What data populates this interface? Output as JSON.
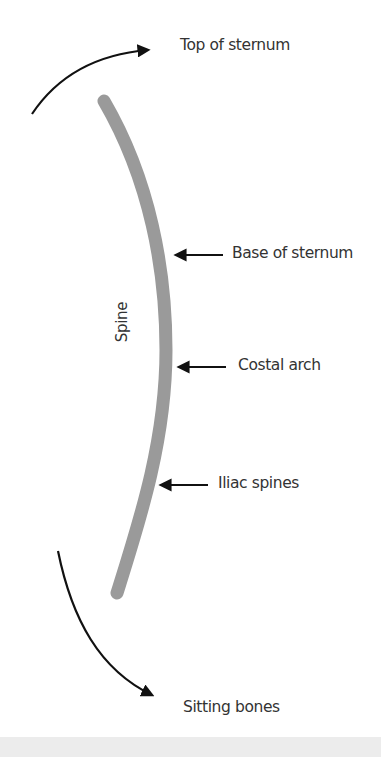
{
  "diagram": {
    "type": "anatomical-posture-diagram",
    "colors": {
      "background": "#ffffff",
      "spine": "#9a9a9a",
      "arrow": "#111111",
      "text": "#333333",
      "footer_band": "#ececec"
    },
    "spine": {
      "label": "Spine"
    },
    "labels": {
      "top": "Top of sternum",
      "base_sternum": "Base of sternum",
      "costal_arch": "Costal arch",
      "iliac_spines": "Iliac spines",
      "bottom": "Sitting bones"
    },
    "arrows": [
      {
        "name": "top-of-sternum-arrow",
        "direction": "curved-up-right",
        "points_to": "Top of sternum"
      },
      {
        "name": "base-of-sternum-arrow",
        "direction": "left",
        "points_to": "Spine"
      },
      {
        "name": "costal-arch-arrow",
        "direction": "left",
        "points_to": "Spine"
      },
      {
        "name": "iliac-spines-arrow",
        "direction": "left",
        "points_to": "Spine"
      },
      {
        "name": "sitting-bones-arrow",
        "direction": "curved-down-right",
        "points_to": "Sitting bones"
      }
    ]
  }
}
